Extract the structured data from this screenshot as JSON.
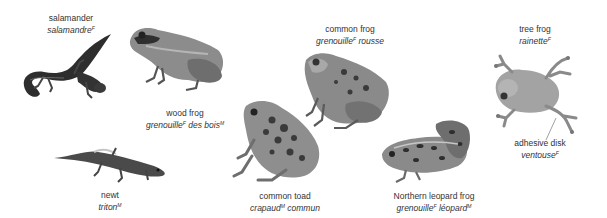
{
  "colors": {
    "background": "#ffffff",
    "text": "#333333",
    "skin_dark": "#3a3a3a",
    "skin_mid": "#8a8a8a",
    "skin_light": "#c4c4c4"
  },
  "animals": [
    {
      "id": "salamander",
      "en": "salamander",
      "fr": "salamandre",
      "gender": "F"
    },
    {
      "id": "wood-frog",
      "en": "wood frog",
      "fr": "grenouille",
      "gender": "F",
      "fr_suffix": " des bois",
      "suffix_gender": "M"
    },
    {
      "id": "common-frog",
      "en": "common frog",
      "fr": "grenouille",
      "gender": "F",
      "fr_suffix": " rousse"
    },
    {
      "id": "tree-frog",
      "en": "tree frog",
      "fr": "rainette",
      "gender": "F"
    },
    {
      "id": "newt",
      "en": "newt",
      "fr": "triton",
      "gender": "M"
    },
    {
      "id": "common-toad",
      "en": "common toad",
      "fr": "crapaud",
      "gender": "M",
      "fr_suffix": " commun"
    },
    {
      "id": "northern-leopard-frog",
      "en": "Northern leopard frog",
      "fr": "grenouille",
      "gender": "F",
      "fr_suffix": " léopard",
      "suffix_gender": "M"
    }
  ],
  "callouts": [
    {
      "id": "adhesive-disk",
      "en": "adhesive disk",
      "fr": "ventouse",
      "gender": "F"
    }
  ]
}
